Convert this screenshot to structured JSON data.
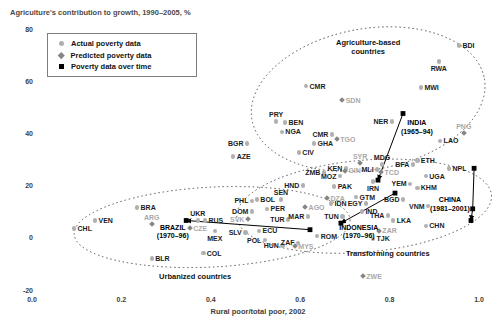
{
  "header": {
    "title": "Agriculture's contribution to growth, 1990–2005, %"
  },
  "legend": {
    "items": [
      {
        "marker": "circle",
        "label": "Actual poverty data"
      },
      {
        "marker": "diamond",
        "label": "Predicted poverty data"
      },
      {
        "marker": "square",
        "label": "Poverty data over time"
      }
    ]
  },
  "colors": {
    "actual_marker": "#b0b0b0",
    "predicted_marker": "#868686",
    "time_series": "#000000",
    "gray_label": "#a9a9a9",
    "black_label": "#1c1c1c",
    "ellipse_stroke": "#4a4a4a"
  },
  "chart_data": {
    "type": "scatter",
    "title": "Agriculture's contribution to growth, 1990–2005, %",
    "xlabel": "Rural poor/total poor, 2002",
    "ylabel": "Agriculture's contribution to growth, 1990–2005, %",
    "xlim": [
      0.0,
      1.0
    ],
    "ylim": [
      -20,
      80
    ],
    "x_ticks": [
      {
        "v": 0.0,
        "t": "0.0"
      },
      {
        "v": 0.2,
        "t": "0.2"
      },
      {
        "v": 0.4,
        "t": "0.4"
      },
      {
        "v": 0.6,
        "t": "0.6"
      },
      {
        "v": 0.8,
        "t": "0.8"
      },
      {
        "v": 1.0,
        "t": "1.0"
      }
    ],
    "y_ticks": [
      {
        "v": 80,
        "t": "80"
      },
      {
        "v": 60,
        "t": "60"
      },
      {
        "v": 40,
        "t": "40"
      },
      {
        "v": 20,
        "t": "20"
      },
      {
        "v": 0,
        "t": "0"
      },
      {
        "v": -20,
        "t": "-20"
      }
    ],
    "series": [
      {
        "name": "Actual poverty data",
        "marker": "circle",
        "points": [
          {
            "c": "BDI",
            "x": 0.955,
            "y": 74,
            "side": "right"
          },
          {
            "c": "RWA",
            "x": 0.91,
            "y": 68,
            "side": "below"
          },
          {
            "c": "MWI",
            "x": 0.87,
            "y": 58,
            "side": "right"
          },
          {
            "c": "CMR",
            "x": 0.613,
            "y": 58.5,
            "side": "right"
          },
          {
            "c": "PRY",
            "x": 0.546,
            "y": 45,
            "side": "above"
          },
          {
            "c": "BEN",
            "x": 0.566,
            "y": 44.5,
            "side": "right"
          },
          {
            "c": "NGA",
            "x": 0.559,
            "y": 41,
            "side": "right"
          },
          {
            "c": "NER",
            "x": 0.805,
            "y": 45,
            "side": "left"
          },
          {
            "c": "BGR",
            "x": 0.481,
            "y": 36.5,
            "side": "left"
          },
          {
            "c": "AZE",
            "x": 0.45,
            "y": 31.5,
            "side": "right"
          },
          {
            "c": "CMR",
            "x": 0.671,
            "y": 40,
            "side": "left"
          },
          {
            "c": "GHA",
            "x": 0.631,
            "y": 36.5,
            "side": "right"
          },
          {
            "c": "CIV",
            "x": 0.597,
            "y": 33,
            "side": "right"
          },
          {
            "c": "LAO",
            "x": 0.913,
            "y": 37.5,
            "side": "right"
          },
          {
            "c": "MDG",
            "x": 0.783,
            "y": 28.5,
            "side": "above"
          },
          {
            "c": "BFA",
            "x": 0.852,
            "y": 28.5,
            "side": "left"
          },
          {
            "c": "ETH",
            "x": 0.862,
            "y": 30,
            "side": "right"
          },
          {
            "c": "NPL",
            "x": 0.933,
            "y": 27,
            "side": "right"
          },
          {
            "c": "KEN",
            "x": 0.702,
            "y": 27,
            "side": "left"
          },
          {
            "c": "ZMB",
            "x": 0.653,
            "y": 25.5,
            "side": "left"
          },
          {
            "c": "MOZ",
            "x": 0.689,
            "y": 24,
            "side": "left"
          },
          {
            "c": "MLI",
            "x": 0.772,
            "y": 26.5,
            "side": "left"
          },
          {
            "c": "UGA",
            "x": 0.881,
            "y": 24,
            "side": "right"
          },
          {
            "c": "HND",
            "x": 0.606,
            "y": 20.5,
            "side": "left"
          },
          {
            "c": "PAK",
            "x": 0.676,
            "y": 20,
            "side": "right"
          },
          {
            "c": "IRN",
            "x": 0.763,
            "y": 22,
            "side": "below"
          },
          {
            "c": "YEM",
            "x": 0.846,
            "y": 21,
            "side": "left"
          },
          {
            "c": "KHM",
            "x": 0.862,
            "y": 19.5,
            "side": "right"
          },
          {
            "c": "SEN",
            "x": 0.557,
            "y": 15,
            "side": "above"
          },
          {
            "c": "PHL",
            "x": 0.492,
            "y": 14.5,
            "side": "left"
          },
          {
            "c": "BOL",
            "x": 0.503,
            "y": 15,
            "side": "right"
          },
          {
            "c": "DOM",
            "x": 0.492,
            "y": 10.5,
            "side": "left"
          },
          {
            "c": "PER",
            "x": 0.526,
            "y": 11.5,
            "side": "right"
          },
          {
            "c": "TUR",
            "x": 0.573,
            "y": 7.5,
            "side": "left"
          },
          {
            "c": "MAR",
            "x": 0.617,
            "y": 8.5,
            "side": "left"
          },
          {
            "c": "GTM",
            "x": 0.725,
            "y": 16,
            "side": "right"
          },
          {
            "c": "IDN",
            "x": 0.669,
            "y": 13.5,
            "side": "right"
          },
          {
            "c": "EGY",
            "x": 0.747,
            "y": 13.5,
            "side": "left"
          },
          {
            "c": "IND",
            "x": 0.738,
            "y": 10.5,
            "side": "right"
          },
          {
            "c": "BGD",
            "x": 0.83,
            "y": 15,
            "side": "left"
          },
          {
            "c": "VNM",
            "x": 0.886,
            "y": 12.5,
            "side": "left"
          },
          {
            "c": "TUN",
            "x": 0.694,
            "y": 8.5,
            "side": "left"
          },
          {
            "c": "THA",
            "x": 0.796,
            "y": 9,
            "side": "left"
          },
          {
            "c": "LKA",
            "x": 0.808,
            "y": 7,
            "side": "right"
          },
          {
            "c": "CHN",
            "x": 0.881,
            "y": 5,
            "side": "right"
          },
          {
            "c": "SLV",
            "x": 0.477,
            "y": 2.5,
            "side": "left"
          },
          {
            "c": "ECU",
            "x": 0.508,
            "y": 3,
            "side": "right"
          },
          {
            "c": "POL",
            "x": 0.521,
            "y": -0.5,
            "side": "left"
          },
          {
            "c": "HUN",
            "x": 0.56,
            "y": -2.5,
            "side": "left"
          },
          {
            "c": "ZAF",
            "x": 0.595,
            "y": -1.5,
            "side": "left"
          },
          {
            "c": "ROM",
            "x": 0.638,
            "y": 1,
            "side": "right"
          },
          {
            "c": "TJK",
            "x": 0.763,
            "y": 0,
            "side": "right"
          },
          {
            "c": "BRA",
            "x": 0.235,
            "y": 12,
            "side": "right"
          },
          {
            "c": "VEN",
            "x": 0.141,
            "y": 7,
            "side": "right"
          },
          {
            "c": "CHL",
            "x": 0.094,
            "y": 4,
            "side": "right"
          },
          {
            "c": "BLR",
            "x": 0.268,
            "y": -7.5,
            "side": "right"
          },
          {
            "c": "UKR",
            "x": 0.371,
            "y": 7,
            "side": "above"
          },
          {
            "c": "RUS",
            "x": 0.387,
            "y": 7,
            "side": "right"
          },
          {
            "c": "MEX",
            "x": 0.409,
            "y": 3,
            "side": "below"
          },
          {
            "c": "COL",
            "x": 0.383,
            "y": -5.5,
            "side": "right"
          }
        ]
      },
      {
        "name": "Predicted poverty data",
        "marker": "diamond",
        "points": [
          {
            "c": "SDN",
            "x": 0.694,
            "y": 53,
            "side": "right"
          },
          {
            "c": "TGO",
            "x": 0.682,
            "y": 38,
            "side": "right"
          },
          {
            "c": "SYR",
            "x": 0.734,
            "y": 29,
            "side": "above"
          },
          {
            "c": "GIN",
            "x": 0.7,
            "y": 26,
            "side": "right"
          },
          {
            "c": "TCD",
            "x": 0.781,
            "y": 25.5,
            "side": "right"
          },
          {
            "c": "PNG",
            "x": 0.966,
            "y": 40.5,
            "side": "above"
          },
          {
            "c": "DZA",
            "x": 0.66,
            "y": 15.5,
            "side": "right"
          },
          {
            "c": "AGO",
            "x": 0.611,
            "y": 12,
            "side": "right"
          },
          {
            "c": "SVK",
            "x": 0.483,
            "y": 7.5,
            "side": "left"
          },
          {
            "c": "MYS",
            "x": 0.588,
            "y": -3,
            "side": "right"
          },
          {
            "c": "ZAR",
            "x": 0.776,
            "y": 3,
            "side": "right"
          },
          {
            "c": "ZWE",
            "x": 0.74,
            "y": -14.5,
            "side": "right"
          },
          {
            "c": "ARG",
            "x": 0.268,
            "y": 5.5,
            "side": "above"
          },
          {
            "c": "CZE",
            "x": 0.353,
            "y": 4,
            "side": "right"
          }
        ]
      }
    ],
    "time_series": [
      {
        "country": "INDIA",
        "period": "(1965–94)",
        "points": [
          [
            0.83,
            48
          ],
          [
            0.774,
            22.5
          ]
        ],
        "label_x": 0.861,
        "label_y": 42.5
      },
      {
        "country": "CHINA",
        "period": "(1981–2001)",
        "points": [
          [
            0.989,
            27
          ],
          [
            0.986,
            11.5
          ],
          [
            0.982,
            7
          ]
        ],
        "label_x": 0.935,
        "label_y": 13
      },
      {
        "country": "BRAZIL",
        "period": "(1970–96)",
        "points": [
          [
            0.622,
            3.5
          ],
          [
            0.345,
            7
          ]
        ],
        "label_x": 0.315,
        "label_y": 2.5
      },
      {
        "country": "INDONESIA",
        "period": "(1970–96)",
        "points": [
          [
            0.812,
            17.5
          ],
          [
            0.691,
            6
          ]
        ],
        "label_x": 0.731,
        "label_y": 2.5
      }
    ],
    "groups": [
      {
        "name": "agriculture-based",
        "lines": [
          "Agriculture-based",
          "countries"
        ],
        "cx": 0.752,
        "cy": 53.5,
        "rx": 0.264,
        "ry": 27,
        "rot": -10,
        "label_x": 0.752,
        "label_y": 73.5
      },
      {
        "name": "transforming",
        "lines": [
          "Transforming countries"
        ],
        "cx": 0.743,
        "cy": 12.5,
        "rx": 0.286,
        "ry": 17.6,
        "rot": -5,
        "label_x": 0.796,
        "label_y": -5.5
      },
      {
        "name": "urbanized",
        "lines": [
          "Urbanized countries"
        ],
        "cx": 0.403,
        "cy": 4.5,
        "rx": 0.309,
        "ry": 15.3,
        "rot": -3,
        "label_x": 0.365,
        "label_y": -14.5
      }
    ],
    "legend_position": "top-left",
    "grid": false
  }
}
